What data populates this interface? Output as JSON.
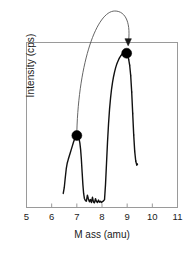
{
  "figure": {
    "width": 192,
    "height": 258,
    "background_color": "#ffffff",
    "frame_color": "#9a9a9a",
    "trace_color": "#111111",
    "marker_color": "#000000",
    "annotation_color": "#555555"
  },
  "axes": {
    "x_label": "M ass (amu)",
    "y_label": "Intensity (cps)",
    "x_tick_labels": [
      "5",
      "6",
      "7",
      "8",
      "9",
      "10",
      "11"
    ]
  },
  "annotation": {
    "arrow_name": "curved-transition-arrow",
    "from_marker_mass": 7,
    "to_marker_mass": 9
  },
  "chart_data": {
    "type": "line",
    "title": "",
    "xlabel": "M ass (amu)",
    "ylabel": "Intensity (cps)",
    "xlim": [
      5,
      11
    ],
    "ylim": [
      0,
      1
    ],
    "grid": false,
    "legend": null,
    "x_ticks": [
      5,
      6,
      7,
      8,
      9,
      10,
      11
    ],
    "y_ticks": [],
    "series": [
      {
        "name": "mass spectrum",
        "x": [
          6.46,
          6.5,
          6.54,
          6.58,
          6.62,
          6.66,
          6.7,
          6.74,
          6.78,
          6.82,
          6.86,
          6.9,
          6.94,
          6.97,
          7.0,
          7.03,
          7.06,
          7.09,
          7.12,
          7.15,
          7.18,
          7.21,
          7.24,
          7.27,
          7.3,
          7.34,
          7.38,
          7.42,
          7.46,
          7.5,
          7.54,
          7.58,
          7.62,
          7.66,
          7.7,
          7.74,
          7.78,
          7.82,
          7.86,
          7.9,
          7.94,
          7.98,
          8.02,
          8.06,
          8.1,
          8.14,
          8.18,
          8.22,
          8.26,
          8.3,
          8.34,
          8.38,
          8.42,
          8.46,
          8.5,
          8.54,
          8.58,
          8.62,
          8.66,
          8.7,
          8.74,
          8.78,
          8.82,
          8.86,
          8.9,
          8.94,
          8.98,
          9.02,
          9.06,
          9.1,
          9.14,
          9.18,
          9.22,
          9.26,
          9.3,
          9.34,
          9.38,
          9.41
        ],
        "y": [
          0.085,
          0.12,
          0.18,
          0.235,
          0.27,
          0.292,
          0.312,
          0.332,
          0.352,
          0.372,
          0.392,
          0.41,
          0.424,
          0.432,
          0.436,
          0.434,
          0.428,
          0.414,
          0.392,
          0.352,
          0.292,
          0.215,
          0.14,
          0.085,
          0.055,
          0.042,
          0.038,
          0.075,
          0.052,
          0.035,
          0.048,
          0.03,
          0.062,
          0.034,
          0.028,
          0.054,
          0.036,
          0.03,
          0.045,
          0.032,
          0.038,
          0.03,
          0.036,
          0.04,
          0.048,
          0.14,
          0.27,
          0.4,
          0.508,
          0.596,
          0.664,
          0.718,
          0.76,
          0.794,
          0.822,
          0.846,
          0.866,
          0.882,
          0.896,
          0.908,
          0.918,
          0.926,
          0.932,
          0.936,
          0.938,
          0.936,
          0.93,
          0.918,
          0.898,
          0.862,
          0.8,
          0.7,
          0.57,
          0.44,
          0.34,
          0.282,
          0.258,
          0.262
        ]
      }
    ],
    "markers": [
      {
        "name": "left-peak-marker",
        "x": 7.0,
        "y": 0.436,
        "label": ""
      },
      {
        "name": "right-peak-marker",
        "x": 8.98,
        "y": 0.935,
        "label": ""
      }
    ]
  }
}
